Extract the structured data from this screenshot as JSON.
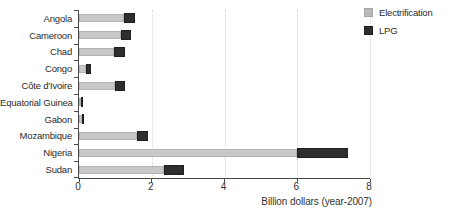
{
  "chart_data": {
    "type": "bar",
    "orientation": "horizontal-stacked",
    "categories": [
      "Angola",
      "Cameroon",
      "Chad",
      "Congo",
      "Côte d'Ivoire",
      "Equatorial Guinea",
      "Gabon",
      "Mozambique",
      "Nigeria",
      "Sudan"
    ],
    "series": [
      {
        "name": "Electrification",
        "color": "#c8c8c8",
        "values": [
          1.25,
          1.15,
          0.97,
          0.18,
          0.98,
          0.05,
          0.07,
          1.6,
          6.0,
          2.35
        ]
      },
      {
        "name": "LPG",
        "color": "#2e2e2e",
        "values": [
          0.3,
          0.28,
          0.3,
          0.14,
          0.28,
          0.03,
          0.04,
          0.3,
          1.4,
          0.55
        ]
      }
    ],
    "title": "",
    "xlabel": "Billion dollars (year-2007)",
    "ylabel": "",
    "xlim": [
      0,
      8
    ],
    "xticks": [
      0,
      2,
      4,
      6,
      8
    ],
    "grid": "vertical dotted lines at x ticks",
    "legend_position": "top-right"
  },
  "colors": {
    "axis": "#4a4a4a",
    "grid": "#d4d4d4",
    "text": "#2b2b2b",
    "background": "#ffffff"
  }
}
